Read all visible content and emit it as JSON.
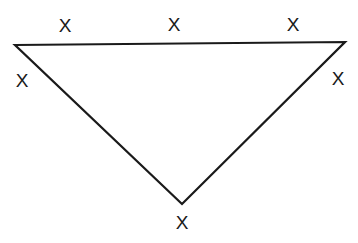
{
  "diagram": {
    "type": "triangle",
    "stroke_color": "#1a1a1a",
    "vertices": {
      "top_left": [
        15,
        45
      ],
      "top_right": [
        345,
        42
      ],
      "bottom": [
        182,
        204
      ]
    },
    "labels": [
      {
        "text": "X",
        "x": 65,
        "y": 32
      },
      {
        "text": "X",
        "x": 174,
        "y": 31
      },
      {
        "text": "X",
        "x": 293,
        "y": 31
      },
      {
        "text": "X",
        "x": 22,
        "y": 87
      },
      {
        "text": "X",
        "x": 338,
        "y": 85
      },
      {
        "text": "X",
        "x": 182,
        "y": 229
      }
    ]
  }
}
